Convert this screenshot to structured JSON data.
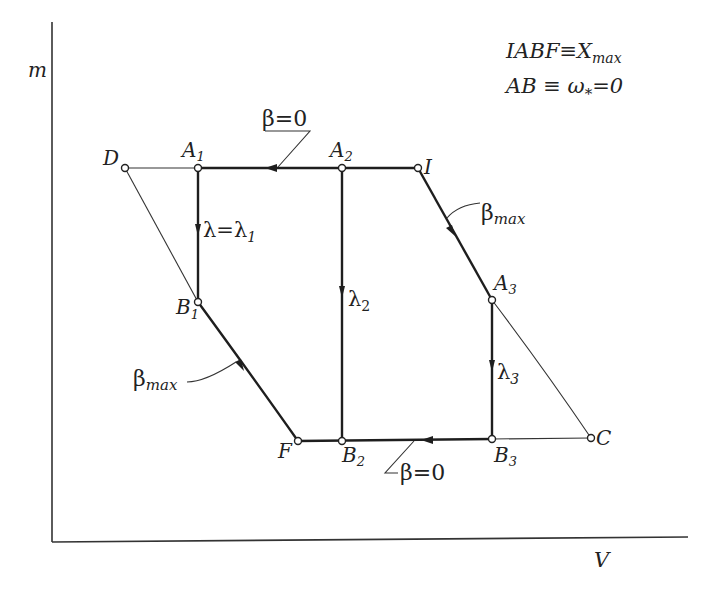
{
  "axes": {
    "y_label": "m",
    "x_label": "V"
  },
  "legend": {
    "line1": {
      "main": "IABF≡X",
      "sub": "max"
    },
    "line2": {
      "main": "AB ≡ ω",
      "sub": "*",
      "tail": "=0"
    }
  },
  "points": {
    "D": {
      "label": "D",
      "sub": ""
    },
    "A1": {
      "label": "A",
      "sub": "1"
    },
    "A2": {
      "label": "A",
      "sub": "2"
    },
    "I": {
      "label": "I",
      "sub": ""
    },
    "A3": {
      "label": "A",
      "sub": "3"
    },
    "B1": {
      "label": "B",
      "sub": "1"
    },
    "F": {
      "label": "F",
      "sub": ""
    },
    "B2": {
      "label": "B",
      "sub": "2"
    },
    "B3": {
      "label": "B",
      "sub": "3"
    },
    "C": {
      "label": "C",
      "sub": ""
    }
  },
  "annotations": {
    "beta_zero_top": "β=0",
    "beta_zero_bottom": "β=0",
    "beta_max_right": {
      "main": "β",
      "sub": "max"
    },
    "beta_max_left": {
      "main": "β",
      "sub": "max"
    },
    "lambda1": {
      "main": "λ=λ",
      "sub": "1"
    },
    "lambda2": {
      "main": "λ",
      "sub": "2"
    },
    "lambda3": {
      "main": "λ",
      "sub": "3"
    }
  }
}
